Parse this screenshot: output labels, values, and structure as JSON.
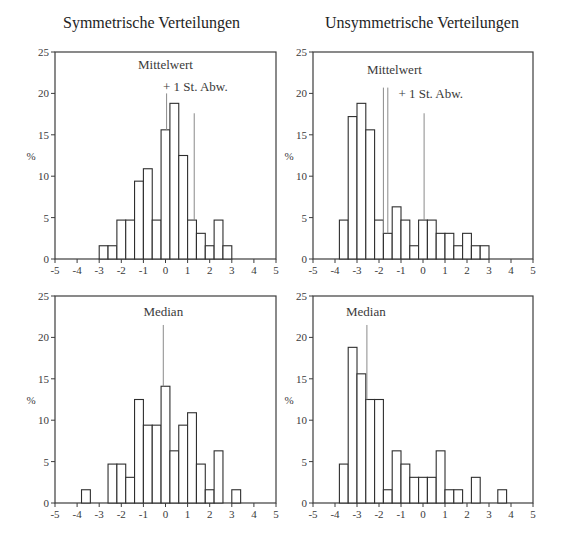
{
  "chart_data": [
    {
      "id": "sym-mean",
      "type": "bar",
      "title": "Symmetrische Verteilungen",
      "xlabel": "",
      "ylabel": "%",
      "xlim": [
        -5,
        5
      ],
      "ylim": [
        0,
        25
      ],
      "xticks": [
        "-5",
        "-4",
        "-3",
        "-2",
        "-1",
        "0",
        "1",
        "2",
        "3",
        "4",
        "5"
      ],
      "yticks": [
        "0",
        "5",
        "10",
        "15",
        "20",
        "25"
      ],
      "bin_width": 0.4,
      "bins_start": [
        -3.0,
        -2.6,
        -2.2,
        -1.8,
        -1.4,
        -1.0,
        -0.6,
        -0.2,
        0.2,
        0.6,
        1.0,
        1.4,
        1.8,
        2.2,
        2.6
      ],
      "values": [
        1.6,
        1.6,
        4.7,
        4.7,
        9.4,
        10.9,
        4.7,
        15.6,
        18.8,
        12.5,
        4.7,
        3.1,
        1.6,
        4.7,
        1.6
      ],
      "annotations": [
        {
          "label": "Mittelwert",
          "x": 0.05,
          "line_top": 20.0,
          "label_x": 0.0,
          "label_y": 22.9
        },
        {
          "label": "+ 1 St. Abw.",
          "x": 1.3,
          "line_top": 17.6,
          "label_x": 1.35,
          "label_y": 20.3
        }
      ]
    },
    {
      "id": "asym-mean",
      "type": "bar",
      "title": "Unsymmetrische Verteilungen",
      "xlabel": "",
      "ylabel": "%",
      "xlim": [
        -5,
        5
      ],
      "ylim": [
        0,
        25
      ],
      "xticks": [
        "-5",
        "-4",
        "-3",
        "-2",
        "-1",
        "0",
        "1",
        "2",
        "3",
        "4",
        "5"
      ],
      "yticks": [
        "0",
        "5",
        "10",
        "15",
        "20",
        "25"
      ],
      "bin_width": 0.4,
      "bins_start": [
        -3.8,
        -3.4,
        -3.0,
        -2.6,
        -2.2,
        -1.8,
        -1.4,
        -1.0,
        -0.6,
        -0.2,
        0.2,
        0.6,
        1.0,
        1.4,
        1.8,
        2.2,
        2.6
      ],
      "values": [
        4.7,
        17.2,
        18.8,
        15.6,
        4.7,
        3.1,
        6.3,
        4.7,
        1.6,
        4.7,
        4.7,
        3.1,
        3.1,
        1.6,
        3.1,
        1.6,
        1.6
      ],
      "annotations": [
        {
          "label": "Mittelwert",
          "x": -1.8,
          "x2": -1.6,
          "line_top": 20.7,
          "label_x": -1.3,
          "label_y": 22.4
        },
        {
          "label": "+ 1 St. Abw.",
          "x": 0.05,
          "line_top": 17.6,
          "label_x": 0.35,
          "label_y": 19.4
        }
      ]
    },
    {
      "id": "sym-median",
      "type": "bar",
      "title": "",
      "xlabel": "",
      "ylabel": "%",
      "xlim": [
        -5,
        5
      ],
      "ylim": [
        0,
        25
      ],
      "xticks": [
        "-5",
        "-4",
        "-3",
        "-2",
        "-1",
        "0",
        "1",
        "2",
        "3",
        "4",
        "5"
      ],
      "yticks": [
        "0",
        "5",
        "10",
        "15",
        "20",
        "25"
      ],
      "bin_width": 0.4,
      "bins_start": [
        -3.8,
        -2.6,
        -2.2,
        -1.8,
        -1.4,
        -1.0,
        -0.6,
        -0.2,
        0.2,
        0.6,
        1.0,
        1.4,
        1.8,
        2.2,
        3.0
      ],
      "values": [
        1.6,
        4.7,
        4.7,
        3.1,
        12.5,
        9.4,
        9.4,
        14.1,
        6.3,
        9.4,
        10.9,
        4.7,
        1.6,
        6.3,
        1.6
      ],
      "annotations": [
        {
          "label": "Median",
          "x": -0.1,
          "line_top": 21.5,
          "label_x": -0.1,
          "label_y": 22.6
        }
      ]
    },
    {
      "id": "asym-median",
      "type": "bar",
      "title": "",
      "xlabel": "",
      "ylabel": "%",
      "xlim": [
        -5,
        5
      ],
      "ylim": [
        0,
        25
      ],
      "xticks": [
        "-5",
        "-4",
        "-3",
        "-2",
        "-1",
        "0",
        "1",
        "2",
        "3",
        "4",
        "5"
      ],
      "yticks": [
        "0",
        "5",
        "10",
        "15",
        "20",
        "25"
      ],
      "bin_width": 0.4,
      "bins_start": [
        -3.8,
        -3.4,
        -3.0,
        -2.6,
        -2.2,
        -1.8,
        -1.4,
        -1.0,
        -0.6,
        -0.2,
        0.2,
        0.6,
        1.0,
        1.4,
        2.2,
        3.4
      ],
      "values": [
        4.7,
        18.8,
        15.6,
        12.5,
        12.5,
        1.6,
        6.3,
        4.7,
        3.1,
        3.1,
        3.1,
        6.3,
        1.6,
        1.6,
        3.1,
        1.6
      ],
      "annotations": [
        {
          "label": "Median",
          "x": -2.55,
          "line_top": 21.5,
          "label_x": -2.6,
          "label_y": 22.6
        }
      ]
    }
  ],
  "panels": {
    "top_left": {
      "title": "Symmetrische Verteilungen"
    },
    "top_right": {
      "title": "Unsymmetrische Verteilungen"
    }
  },
  "colors": {
    "axis": "#3c3c3c",
    "bar_fill": "#ffffff",
    "bar_stroke": "#2e2e2e",
    "annotation_line": "#8a8a8a",
    "text": "#2a2a2a"
  }
}
